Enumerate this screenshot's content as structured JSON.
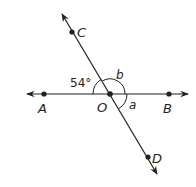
{
  "figure": {
    "type": "intersecting-lines-angle-diagram",
    "colors": {
      "line": "#231f20",
      "background": "#ffffff"
    },
    "points": [
      {
        "name": "A",
        "label": "A",
        "x": 44,
        "y": 94
      },
      {
        "name": "B",
        "label": "B",
        "x": 169,
        "y": 94
      },
      {
        "name": "C",
        "label": "C",
        "x": 72,
        "y": 32
      },
      {
        "name": "D",
        "label": "D",
        "x": 148,
        "y": 157
      },
      {
        "name": "O",
        "label": "O",
        "x": 110,
        "y": 94
      }
    ],
    "lines": [
      {
        "name": "line-AB",
        "through": [
          "A",
          "B"
        ]
      },
      {
        "name": "line-CD",
        "through": [
          "C",
          "D"
        ]
      }
    ],
    "angles": [
      {
        "name": "angle-AOC",
        "label": "54°",
        "measure_deg": 54
      },
      {
        "name": "angle-COB",
        "label": "b"
      },
      {
        "name": "angle-BOD",
        "label": "a"
      }
    ]
  },
  "labels": {
    "A": "A",
    "B": "B",
    "C": "C",
    "D": "D",
    "O": "O",
    "angle_54": "54°",
    "angle_b": "b",
    "angle_a": "a"
  }
}
